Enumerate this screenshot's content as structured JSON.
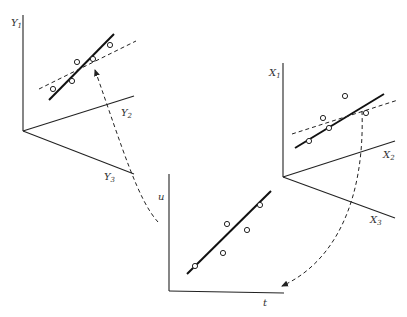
{
  "diagram": {
    "panels": {
      "y_space": {
        "axes": [
          {
            "name": "Y",
            "sub": "1"
          },
          {
            "name": "Y",
            "sub": "2"
          },
          {
            "name": "Y",
            "sub": "3"
          }
        ],
        "points": 5,
        "lines": [
          "solid fit line",
          "dashed fit line"
        ]
      },
      "x_space": {
        "axes": [
          {
            "name": "X",
            "sub": "1"
          },
          {
            "name": "X",
            "sub": "2"
          },
          {
            "name": "X",
            "sub": "3"
          }
        ],
        "points": 5,
        "lines": [
          "solid fit line",
          "dashed fit line"
        ]
      },
      "ut_plane": {
        "axes": [
          {
            "name": "u"
          },
          {
            "name": "t"
          }
        ],
        "points": 5,
        "lines": [
          "solid fit line"
        ]
      }
    },
    "arrows": [
      {
        "from": "x_space",
        "to": "ut_plane",
        "style": "dashed"
      },
      {
        "from": "ut_plane",
        "to": "y_space",
        "style": "dashed"
      }
    ]
  },
  "colors": {
    "ink": "#222222",
    "background": "#ffffff"
  }
}
